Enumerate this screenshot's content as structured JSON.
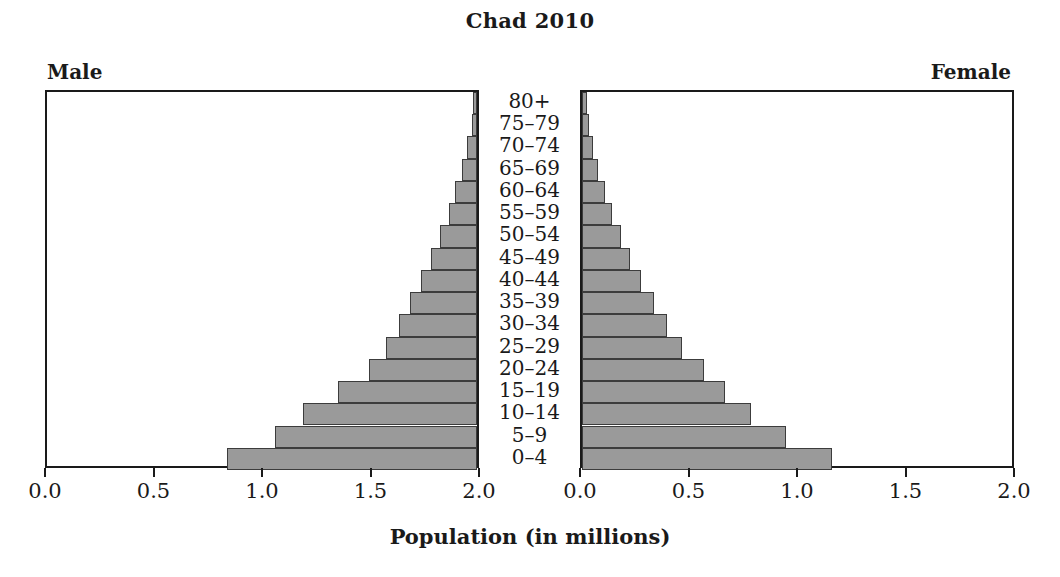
{
  "chart_data": {
    "type": "bar",
    "title": "Chad 2010",
    "xlabel": "Population (in millions)",
    "ylabel": "",
    "subtitle": "",
    "orientation": "horizontal",
    "layout": "population-pyramid",
    "grid": false,
    "legend_position": "none",
    "panels": [
      {
        "name": "male",
        "label": "Male",
        "axis_reversed": true
      },
      {
        "name": "female",
        "label": "Female",
        "axis_reversed": false
      }
    ],
    "categories": [
      "0-4",
      "5-9",
      "10-14",
      "15-19",
      "20-24",
      "25-29",
      "30-34",
      "35-39",
      "40-44",
      "45-49",
      "50-54",
      "55-59",
      "60-64",
      "65-69",
      "70-74",
      "75-79",
      "80+"
    ],
    "category_labels_display": [
      "80+",
      "75–79",
      "70–74",
      "65–69",
      "60–64",
      "55–59",
      "50–54",
      "45–49",
      "40–44",
      "35–39",
      "30–34",
      "25–29",
      "20–24",
      "15–19",
      "10–14",
      "5–9",
      "0–4"
    ],
    "xlim": [
      0,
      2.0
    ],
    "xticks": [
      0.0,
      0.5,
      1.0,
      1.5,
      2.0
    ],
    "xtick_labels_male": [
      "2.0",
      "1.5",
      "1.0",
      "0.5",
      "0.0"
    ],
    "xtick_labels_female": [
      "0.0",
      "0.5",
      "1.0",
      "1.5",
      "2.0"
    ],
    "series": [
      {
        "name": "Male",
        "values": [
          1.15,
          0.93,
          0.8,
          0.64,
          0.5,
          0.42,
          0.36,
          0.31,
          0.26,
          0.21,
          0.17,
          0.13,
          0.1,
          0.07,
          0.045,
          0.025,
          0.018
        ]
      },
      {
        "name": "Female",
        "values": [
          1.15,
          0.94,
          0.78,
          0.66,
          0.56,
          0.46,
          0.39,
          0.33,
          0.27,
          0.22,
          0.18,
          0.14,
          0.105,
          0.075,
          0.05,
          0.03,
          0.022
        ]
      }
    ],
    "colors": {
      "bar_fill": "#9a9a9a",
      "bar_edge": "#3c3c3c",
      "frame": "#1a1a1a",
      "text": "#1a1a1a",
      "background": "#ffffff"
    }
  }
}
